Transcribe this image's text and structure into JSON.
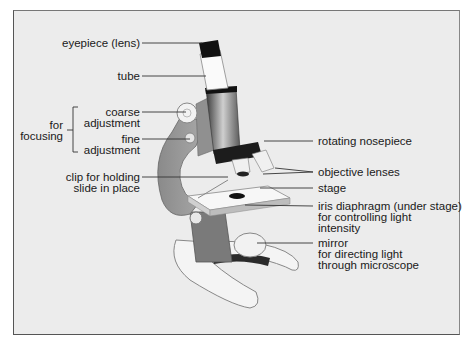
{
  "diagram": {
    "subject": "microscope",
    "labels": {
      "eyepiece": "eyepiece (lens)",
      "tube": "tube",
      "coarse_1": "coarse",
      "coarse_2": "adjustment",
      "fine_1": "fine",
      "fine_2": "adjustment",
      "focusing_1": "for",
      "focusing_2": "focusing",
      "clip_1": "clip for holding",
      "clip_2": "slide in place",
      "nosepiece": "rotating nosepiece",
      "objective": "objective lenses",
      "stage": "stage",
      "iris_1": "iris diaphragm (under stage)",
      "iris_2": "for controlling light",
      "iris_3": "intensity",
      "mirror_1": "mirror",
      "mirror_2": "for directing light",
      "mirror_3": "through microscope"
    },
    "colors": {
      "background": "#ececec",
      "frame": "#555555",
      "text": "#1a1a1a"
    }
  }
}
